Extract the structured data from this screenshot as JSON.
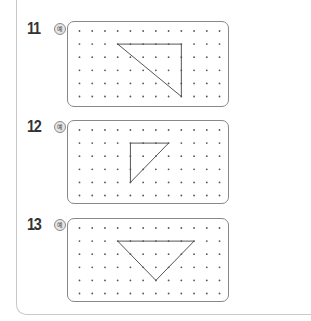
{
  "grid": {
    "cols": 12,
    "rows": 6,
    "dot_color": "#555555",
    "line_color": "#555555"
  },
  "problems": [
    {
      "number": "11",
      "badge": "예",
      "top": 21,
      "height": 86,
      "triangle": [
        [
          3,
          1
        ],
        [
          8,
          1
        ],
        [
          8,
          5
        ]
      ]
    },
    {
      "number": "12",
      "badge": "예",
      "top": 120,
      "height": 84,
      "triangle": [
        [
          4,
          1
        ],
        [
          7,
          1
        ],
        [
          4,
          4
        ]
      ]
    },
    {
      "number": "13",
      "badge": "예",
      "top": 218,
      "height": 84,
      "triangle": [
        [
          3,
          1
        ],
        [
          9,
          1
        ],
        [
          6,
          4
        ]
      ]
    }
  ]
}
